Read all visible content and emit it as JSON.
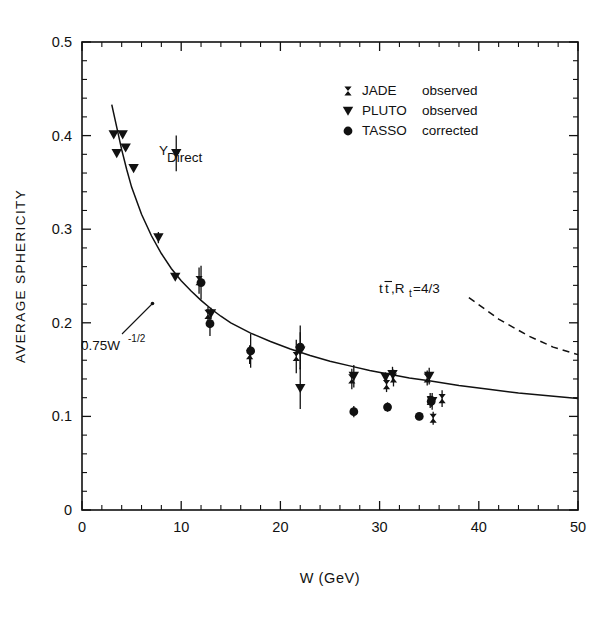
{
  "figure": {
    "title": "",
    "background_color": "#ffffff",
    "ink_color": "#111111"
  },
  "axes": {
    "x_title": "W (GeV)",
    "y_title": "AVERAGE SPHERICITY",
    "x_ticklabels": [
      "0",
      "10",
      "20",
      "30",
      "40",
      "50"
    ],
    "y_ticklabels": [
      "0",
      "0.1",
      "0.2",
      "0.3",
      "0.4",
      "0.5"
    ]
  },
  "legend": {
    "items": [
      {
        "marker": "errorbar-marker",
        "name": "JADE",
        "status": "observed"
      },
      {
        "marker": "triangle-down-marker",
        "name": "PLUTO",
        "status": "observed"
      },
      {
        "marker": "circle-marker",
        "name": "TASSO",
        "status": "corrected"
      }
    ]
  },
  "annotations": {
    "upsilon": {
      "text": "Υ",
      "subscript": "Direct"
    },
    "fit_curve": {
      "text": "0.75W",
      "exponent": "-1/2"
    },
    "ttbar": {
      "text": "t",
      "bar_text": "t",
      "rest": ",R",
      "sub": "t",
      "value": "=4/3"
    }
  },
  "chart_data": {
    "type": "scatter",
    "title": "",
    "xlabel": "W (GeV)",
    "ylabel": "AVERAGE SPHERICITY",
    "xlim": [
      0,
      50
    ],
    "ylim": [
      0,
      0.5
    ],
    "xticks": [
      0,
      10,
      20,
      30,
      40,
      50
    ],
    "yticks": [
      0,
      0.1,
      0.2,
      0.3,
      0.4,
      0.5
    ],
    "x_minor_step": 2,
    "y_minor_step": 0.02,
    "grid": false,
    "legend_position": "upper-right",
    "series": [
      {
        "name": "PLUTO observed",
        "marker": "triangle-down",
        "points": [
          {
            "x": 3.2,
            "y": 0.401,
            "yerr": 0.0
          },
          {
            "x": 3.5,
            "y": 0.381,
            "yerr": 0.0
          },
          {
            "x": 4.1,
            "y": 0.401,
            "yerr": 0.0
          },
          {
            "x": 4.4,
            "y": 0.387,
            "yerr": 0.0
          },
          {
            "x": 5.2,
            "y": 0.365,
            "yerr": 0.0
          },
          {
            "x": 7.7,
            "y": 0.291,
            "yerr": 0.006
          },
          {
            "x": 9.4,
            "y": 0.249,
            "yerr": 0.0
          },
          {
            "x": 13.0,
            "y": 0.21,
            "yerr": 0.006
          },
          {
            "x": 22.0,
            "y": 0.17,
            "yerr": 0.02
          },
          {
            "x": 22.0,
            "y": 0.13,
            "yerr": 0.022
          },
          {
            "x": 27.4,
            "y": 0.143,
            "yerr": 0.012
          },
          {
            "x": 30.6,
            "y": 0.142,
            "yerr": 0.005
          },
          {
            "x": 31.3,
            "y": 0.145,
            "yerr": 0.008
          },
          {
            "x": 35.0,
            "y": 0.143,
            "yerr": 0.009
          },
          {
            "x": 35.3,
            "y": 0.116,
            "yerr": 0.009
          }
        ]
      },
      {
        "name": "TASSO corrected",
        "marker": "circle",
        "points": [
          {
            "x": 12.0,
            "y": 0.243,
            "yerr": 0.018
          },
          {
            "x": 12.9,
            "y": 0.199,
            "yerr": 0.013
          },
          {
            "x": 17.0,
            "y": 0.17,
            "yerr": 0.018
          },
          {
            "x": 22.0,
            "y": 0.174,
            "yerr": 0.023
          },
          {
            "x": 27.4,
            "y": 0.105,
            "yerr": 0.006
          },
          {
            "x": 30.8,
            "y": 0.11,
            "yerr": 0.005
          },
          {
            "x": 34.0,
            "y": 0.1,
            "yerr": 0.004
          },
          {
            "x": 35.2,
            "y": 0.116,
            "yerr": 0.006
          }
        ]
      },
      {
        "name": "JADE observed",
        "marker": "errorbar",
        "points": [
          {
            "x": 11.8,
            "y": 0.245,
            "yerr": 0.014
          },
          {
            "x": 12.7,
            "y": 0.209,
            "yerr": 0.008
          },
          {
            "x": 16.9,
            "y": 0.166,
            "yerr": 0.01
          },
          {
            "x": 21.6,
            "y": 0.164,
            "yerr": 0.018
          },
          {
            "x": 27.2,
            "y": 0.14,
            "yerr": 0.011
          },
          {
            "x": 30.7,
            "y": 0.134,
            "yerr": 0.008
          },
          {
            "x": 31.4,
            "y": 0.141,
            "yerr": 0.009
          },
          {
            "x": 34.8,
            "y": 0.141,
            "yerr": 0.008
          },
          {
            "x": 35.1,
            "y": 0.117,
            "yerr": 0.008
          },
          {
            "x": 35.4,
            "y": 0.098,
            "yerr": 0.007
          },
          {
            "x": 36.3,
            "y": 0.119,
            "yerr": 0.009
          }
        ]
      },
      {
        "name": "Upsilon Direct",
        "marker": "triangle-down",
        "points": [
          {
            "x": 9.5,
            "y": 0.381,
            "yerr": 0.019
          }
        ]
      }
    ],
    "curves": [
      {
        "name": "0.75 W^-1/2 fit",
        "style": "solid",
        "formula": "0.75*W^(-1/2)+0.0",
        "points": [
          {
            "x": 3.0,
            "y": 0.433
          },
          {
            "x": 3.5,
            "y": 0.409
          },
          {
            "x": 4.0,
            "y": 0.385
          },
          {
            "x": 4.5,
            "y": 0.364
          },
          {
            "x": 5.0,
            "y": 0.345
          },
          {
            "x": 6.0,
            "y": 0.316
          },
          {
            "x": 7.0,
            "y": 0.293
          },
          {
            "x": 8.0,
            "y": 0.274
          },
          {
            "x": 9.0,
            "y": 0.258
          },
          {
            "x": 10.0,
            "y": 0.245
          },
          {
            "x": 11.0,
            "y": 0.234
          },
          {
            "x": 12.0,
            "y": 0.224
          },
          {
            "x": 13.0,
            "y": 0.215
          },
          {
            "x": 14.0,
            "y": 0.207
          },
          {
            "x": 15.0,
            "y": 0.2
          },
          {
            "x": 17.0,
            "y": 0.189
          },
          {
            "x": 19.0,
            "y": 0.18
          },
          {
            "x": 21.0,
            "y": 0.172
          },
          {
            "x": 23.0,
            "y": 0.165
          },
          {
            "x": 25.0,
            "y": 0.159
          },
          {
            "x": 27.0,
            "y": 0.154
          },
          {
            "x": 29.0,
            "y": 0.149
          },
          {
            "x": 31.0,
            "y": 0.145
          },
          {
            "x": 33.0,
            "y": 0.141
          },
          {
            "x": 35.0,
            "y": 0.138
          },
          {
            "x": 38.0,
            "y": 0.133
          },
          {
            "x": 41.0,
            "y": 0.129
          },
          {
            "x": 44.0,
            "y": 0.125
          },
          {
            "x": 47.0,
            "y": 0.122
          },
          {
            "x": 50.0,
            "y": 0.119
          }
        ]
      },
      {
        "name": "ttbar Rt=4/3 prediction",
        "style": "dashed",
        "points": [
          {
            "x": 39.0,
            "y": 0.227
          },
          {
            "x": 42.0,
            "y": 0.204
          },
          {
            "x": 45.0,
            "y": 0.186
          },
          {
            "x": 47.5,
            "y": 0.174
          },
          {
            "x": 50.0,
            "y": 0.166
          }
        ]
      }
    ]
  }
}
